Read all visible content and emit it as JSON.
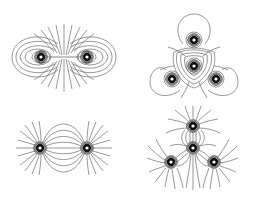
{
  "figure": {
    "colors": {
      "line": "#6a6a6a",
      "charge": "#111111",
      "background": "#ffffff"
    },
    "panels": [
      {
        "id": "top-left",
        "configuration": "two like charges",
        "charge_count": 2,
        "charges": [
          {
            "x": 41,
            "y": 57
          },
          {
            "x": 87,
            "y": 57
          }
        ]
      },
      {
        "id": "top-right",
        "configuration": "four charges, trigonal arrangement, closed loops",
        "charge_count": 4,
        "charges": [
          {
            "x": 194,
            "y": 40
          },
          {
            "x": 194,
            "y": 66
          },
          {
            "x": 172,
            "y": 79
          },
          {
            "x": 216,
            "y": 79
          }
        ]
      },
      {
        "id": "bottom-left",
        "configuration": "two opposite charges (dipole)",
        "charge_count": 2,
        "charges": [
          {
            "x": 40,
            "y": 148
          },
          {
            "x": 87,
            "y": 148
          }
        ]
      },
      {
        "id": "bottom-right",
        "configuration": "four charges, trigonal arrangement, radial field lines",
        "charge_count": 4,
        "charges": [
          {
            "x": 193,
            "y": 126
          },
          {
            "x": 193,
            "y": 148
          },
          {
            "x": 171,
            "y": 162
          },
          {
            "x": 214,
            "y": 162
          }
        ]
      }
    ]
  }
}
